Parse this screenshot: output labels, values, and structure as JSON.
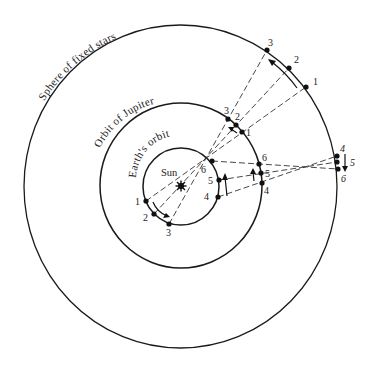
{
  "diagram": {
    "type": "retrograde-motion",
    "labels": {
      "sphere": "Sphere of fixed stars",
      "jupiter": "Orbit of Jupiter",
      "earth": "Earth's orbit",
      "sun": "Sun"
    },
    "earth_positions": [
      {
        "id": "1",
        "x": 146,
        "y": 201
      },
      {
        "id": "2",
        "x": 154,
        "y": 214
      },
      {
        "id": "3",
        "x": 169,
        "y": 224
      },
      {
        "id": "4",
        "x": 218,
        "y": 197
      },
      {
        "id": "5",
        "x": 219,
        "y": 180
      },
      {
        "id": "6",
        "x": 212,
        "y": 161
      }
    ],
    "jupiter_positions": [
      {
        "id": "1",
        "x": 242,
        "y": 132
      },
      {
        "id": "2",
        "x": 236,
        "y": 125
      },
      {
        "id": "3",
        "x": 228,
        "y": 119
      },
      {
        "id": "4",
        "x": 262,
        "y": 183
      },
      {
        "id": "5",
        "x": 261,
        "y": 173
      },
      {
        "id": "6",
        "x": 259,
        "y": 164
      }
    ],
    "star_positions": [
      {
        "id": "1",
        "x": 306,
        "y": 87
      },
      {
        "id": "2",
        "x": 289,
        "y": 68
      },
      {
        "id": "3",
        "x": 267,
        "y": 50
      },
      {
        "id": "4",
        "x": 337,
        "y": 156
      },
      {
        "id": "5",
        "x": 337,
        "y": 162
      },
      {
        "id": "6",
        "x": 338,
        "y": 169
      }
    ],
    "colors": {
      "line": "#1a1a1a",
      "background": "#ffffff"
    }
  }
}
